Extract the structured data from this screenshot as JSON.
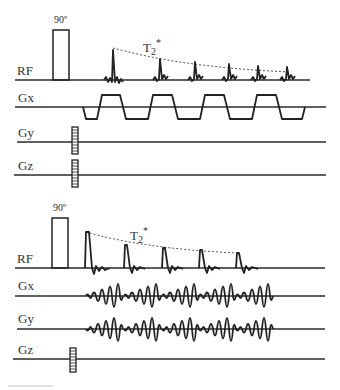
{
  "diagram": {
    "panels": [
      {
        "id": "epi",
        "rf_label": "RF",
        "flip_angle_label": "90º",
        "decay_label": "T",
        "decay_sub": "2",
        "decay_sup": "*",
        "channels": [
          {
            "label": "RF"
          },
          {
            "label": "Gx"
          },
          {
            "label": "Gy"
          },
          {
            "label": "Gz"
          }
        ],
        "echo_count": 6
      },
      {
        "id": "spiral",
        "rf_label": "RF",
        "flip_angle_label": "90º",
        "decay_label": "T",
        "decay_sub": "2",
        "decay_sup": "*",
        "channels": [
          {
            "label": "RF"
          },
          {
            "label": "Gx"
          },
          {
            "label": "Gy"
          },
          {
            "label": "Gz"
          }
        ],
        "echo_count": 5
      }
    ],
    "colors": {
      "line": "#222222",
      "background": "#ffffff"
    }
  }
}
